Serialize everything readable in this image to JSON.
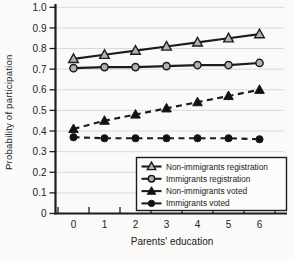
{
  "figure": {
    "kind": "scanned-statistical-line-chart",
    "background": "#fbfaf8"
  },
  "chart_data": {
    "type": "line",
    "title": "",
    "xlabel": "Parents' education",
    "ylabel": "Probability of participation",
    "x_categories": [
      "0",
      "1",
      "2",
      "3",
      "4",
      "5",
      "6"
    ],
    "y_ticks": [
      "0",
      "0.1",
      "0.2",
      "0.3",
      "0.4",
      "0.5",
      "0.6",
      "0.7",
      "0.8",
      "0.9",
      "1.0"
    ],
    "ylim": [
      0,
      1
    ],
    "grid": "horizontal-light",
    "legend_position": "lower-right-inside",
    "series": [
      {
        "name": "Non-immigrants registration",
        "marker": "triangle-open",
        "line": "solid",
        "values": [
          0.75,
          0.77,
          0.79,
          0.81,
          0.83,
          0.85,
          0.87
        ]
      },
      {
        "name": "Immigrants registration",
        "marker": "circle-open",
        "line": "solid",
        "values": [
          0.705,
          0.71,
          0.71,
          0.715,
          0.72,
          0.72,
          0.73
        ]
      },
      {
        "name": "Non-immigrants voted",
        "marker": "triangle-filled",
        "line": "dashed",
        "values": [
          0.41,
          0.45,
          0.48,
          0.51,
          0.54,
          0.57,
          0.6
        ]
      },
      {
        "name": "Immigrants voted",
        "marker": "circle-filled",
        "line": "dashed",
        "values": [
          0.37,
          0.365,
          0.365,
          0.365,
          0.365,
          0.365,
          0.36
        ]
      }
    ],
    "colors": {
      "line": "#1c1c1c",
      "axis": "#1c1c1c",
      "text": "#222222",
      "grid": "#d9d9d6",
      "marker_open_fill": "#b2b2b0",
      "marker_filled": "#111111",
      "legend_bg": "#fcfcfa",
      "legend_border": "#1c1c1c"
    }
  }
}
